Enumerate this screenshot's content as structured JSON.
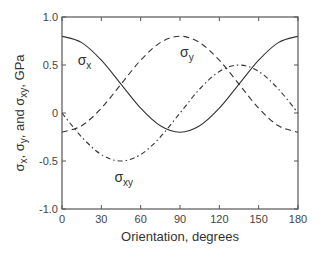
{
  "chart_data": {
    "type": "line",
    "title": "",
    "xlabel": "Orientation, degrees",
    "ylabel": "σx, σy, and σxy, GPa",
    "xlim": [
      0,
      180
    ],
    "ylim": [
      -1.0,
      1.0
    ],
    "xticks": [
      "0",
      "30",
      "60",
      "90",
      "120",
      "150",
      "180"
    ],
    "yticks": [
      "-1.0",
      "-0.5",
      "0",
      "0.5",
      "1.0"
    ],
    "grid": false,
    "legend": "inline labels",
    "x": [
      0,
      15,
      30,
      45,
      60,
      75,
      90,
      105,
      120,
      135,
      150,
      165,
      180
    ],
    "series": [
      {
        "name": "σx",
        "style": "solid",
        "values": [
          0.8,
          0.733,
          0.55,
          0.3,
          0.05,
          -0.133,
          -0.2,
          -0.133,
          0.05,
          0.3,
          0.55,
          0.733,
          0.8
        ]
      },
      {
        "name": "σy",
        "style": "dashed",
        "values": [
          -0.2,
          -0.133,
          0.05,
          0.3,
          0.55,
          0.733,
          0.8,
          0.733,
          0.55,
          0.3,
          0.05,
          -0.133,
          -0.2
        ]
      },
      {
        "name": "σxy",
        "style": "dash-dot",
        "values": [
          0.0,
          -0.25,
          -0.433,
          -0.5,
          -0.433,
          -0.25,
          0.0,
          0.25,
          0.433,
          0.5,
          0.433,
          0.25,
          0.0
        ]
      }
    ],
    "annotations": [
      {
        "text": "σx",
        "main": "σ",
        "sub": "x",
        "x": 12,
        "y": 0.5
      },
      {
        "text": "σy",
        "main": "σ",
        "sub": "y",
        "x": 90,
        "y": 0.58
      },
      {
        "text": "σxy",
        "main": "σ",
        "sub": "xy",
        "x": 40,
        "y": -0.72
      }
    ]
  },
  "labels": {
    "x_axis": "Orientation, degrees",
    "y_axis_parts": [
      "σ",
      "x",
      ", σ",
      "y",
      ", and σ",
      "xy",
      ", GPa"
    ]
  }
}
